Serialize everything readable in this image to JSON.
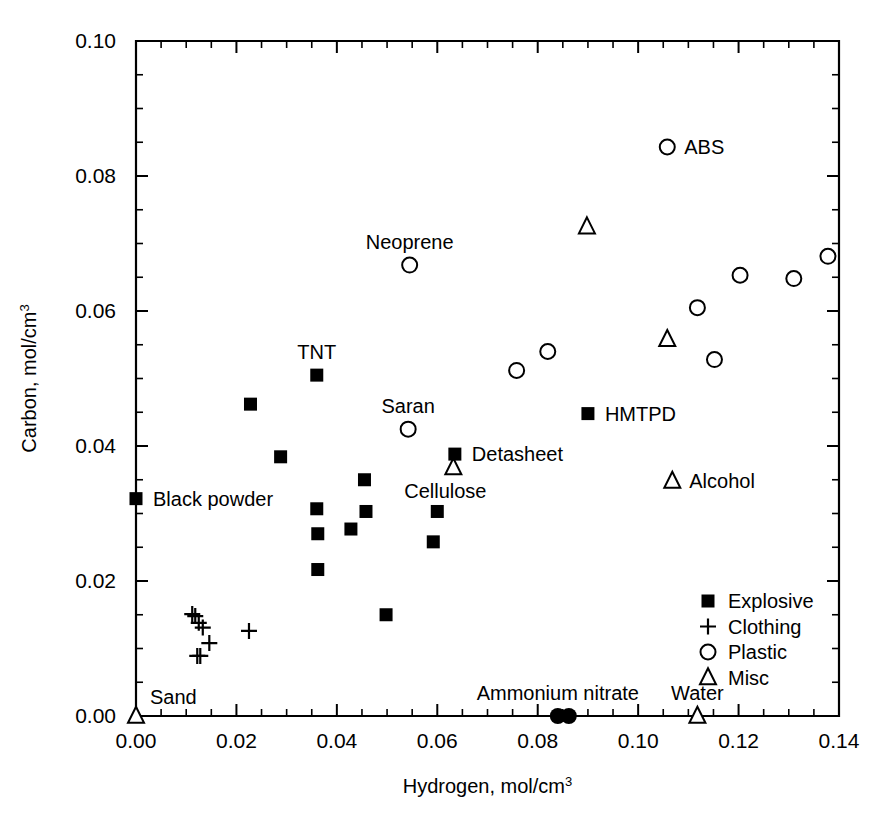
{
  "chart_data": {
    "type": "scatter",
    "title": "",
    "xlabel": "Hydrogen, mol/cm",
    "xlabel_sup": "3",
    "ylabel": "Carbon, mol/cm",
    "ylabel_sup": "3",
    "xlim": [
      0.0,
      0.14
    ],
    "ylim": [
      0.0,
      0.1
    ],
    "x_major_step": 0.02,
    "y_major_step": 0.02,
    "x_minor_step": 0.005,
    "y_minor_step": 0.005,
    "grid": false,
    "xticklabels": [
      "0.00",
      "0.02",
      "0.04",
      "0.06",
      "0.08",
      "0.10",
      "0.12",
      "0.14"
    ],
    "yticklabels": [
      "0.00",
      "0.02",
      "0.04",
      "0.06",
      "0.08",
      "0.10"
    ],
    "legend_position": "lower-right",
    "legend": [
      {
        "marker": "filled-square",
        "label": "Explosive"
      },
      {
        "marker": "plus",
        "label": "Clothing"
      },
      {
        "marker": "open-circle",
        "label": "Plastic"
      },
      {
        "marker": "open-triangle",
        "label": "Misc"
      }
    ],
    "series": [
      {
        "name": "Explosive",
        "marker": "filled-square",
        "points": [
          {
            "x": 0.0,
            "y": 0.0322,
            "label": "Black powder",
            "label_pos": "right"
          },
          {
            "x": 0.0228,
            "y": 0.0462,
            "label": "",
            "label_pos": ""
          },
          {
            "x": 0.0288,
            "y": 0.0384,
            "label": "",
            "label_pos": ""
          },
          {
            "x": 0.036,
            "y": 0.0505,
            "label": "TNT",
            "label_pos": "above"
          },
          {
            "x": 0.036,
            "y": 0.0307,
            "label": "",
            "label_pos": ""
          },
          {
            "x": 0.0362,
            "y": 0.027,
            "label": "",
            "label_pos": ""
          },
          {
            "x": 0.0362,
            "y": 0.0217,
            "label": "",
            "label_pos": ""
          },
          {
            "x": 0.0428,
            "y": 0.0277,
            "label": "",
            "label_pos": ""
          },
          {
            "x": 0.0455,
            "y": 0.035,
            "label": "",
            "label_pos": ""
          },
          {
            "x": 0.0458,
            "y": 0.0303,
            "label": "",
            "label_pos": ""
          },
          {
            "x": 0.0498,
            "y": 0.015,
            "label": "",
            "label_pos": ""
          },
          {
            "x": 0.0592,
            "y": 0.0258,
            "label": "",
            "label_pos": ""
          },
          {
            "x": 0.06,
            "y": 0.0303,
            "label": "",
            "label_pos": ""
          },
          {
            "x": 0.0635,
            "y": 0.0388,
            "label": "Detasheet",
            "label_pos": "right"
          },
          {
            "x": 0.09,
            "y": 0.0448,
            "label": "HMTPD",
            "label_pos": "right"
          }
        ]
      },
      {
        "name": "Clothing",
        "marker": "plus",
        "points": [
          {
            "x": 0.0112,
            "y": 0.0151,
            "label": "",
            "label_pos": ""
          },
          {
            "x": 0.0118,
            "y": 0.0148,
            "label": "",
            "label_pos": ""
          },
          {
            "x": 0.0125,
            "y": 0.0138,
            "label": "",
            "label_pos": ""
          },
          {
            "x": 0.0133,
            "y": 0.0131,
            "label": "",
            "label_pos": ""
          },
          {
            "x": 0.0146,
            "y": 0.0108,
            "label": "",
            "label_pos": ""
          },
          {
            "x": 0.0122,
            "y": 0.0089,
            "label": "",
            "label_pos": ""
          },
          {
            "x": 0.0128,
            "y": 0.0089,
            "label": "",
            "label_pos": ""
          },
          {
            "x": 0.0225,
            "y": 0.0126,
            "label": "",
            "label_pos": ""
          }
        ]
      },
      {
        "name": "Plastic",
        "marker": "open-circle",
        "points": [
          {
            "x": 0.0542,
            "y": 0.0425,
            "label": "Saran",
            "label_pos": "above"
          },
          {
            "x": 0.0545,
            "y": 0.0668,
            "label": "Neoprene",
            "label_pos": "above"
          },
          {
            "x": 0.0758,
            "y": 0.0512,
            "label": "",
            "label_pos": ""
          },
          {
            "x": 0.082,
            "y": 0.054,
            "label": "",
            "label_pos": ""
          },
          {
            "x": 0.1058,
            "y": 0.0843,
            "label": "ABS",
            "label_pos": "right"
          },
          {
            "x": 0.1118,
            "y": 0.0605,
            "label": "",
            "label_pos": ""
          },
          {
            "x": 0.1152,
            "y": 0.0528,
            "label": "",
            "label_pos": ""
          },
          {
            "x": 0.1203,
            "y": 0.0653,
            "label": "",
            "label_pos": ""
          },
          {
            "x": 0.131,
            "y": 0.0648,
            "label": "",
            "label_pos": ""
          },
          {
            "x": 0.1378,
            "y": 0.0681,
            "label": "",
            "label_pos": ""
          }
        ]
      },
      {
        "name": "Misc",
        "marker": "open-triangle",
        "points": [
          {
            "x": 0.0,
            "y": 0.0,
            "label": "Sand",
            "label_pos": "above-right"
          },
          {
            "x": 0.0632,
            "y": 0.0368,
            "label": "Cellulose",
            "label_pos": "below"
          },
          {
            "x": 0.0898,
            "y": 0.0725,
            "label": "",
            "label_pos": ""
          },
          {
            "x": 0.1058,
            "y": 0.0558,
            "label": "",
            "label_pos": ""
          },
          {
            "x": 0.1068,
            "y": 0.0348,
            "label": "Alcohol",
            "label_pos": "right"
          },
          {
            "x": 0.1118,
            "y": 0.0,
            "label": "Water",
            "label_pos": "above"
          }
        ]
      },
      {
        "name": "Ammonium nitrate",
        "marker": "filled-circle",
        "points": [
          {
            "x": 0.084,
            "y": 0.0,
            "label": "Ammonium nitrate",
            "label_pos": "above"
          },
          {
            "x": 0.0862,
            "y": 0.0,
            "label": "",
            "label_pos": ""
          }
        ]
      }
    ]
  }
}
